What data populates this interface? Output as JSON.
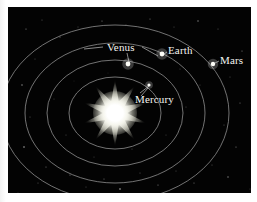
{
  "figure": {
    "title": "Solar System Inner Planets Orbit Diagram",
    "background_color": "#030303",
    "page_color": "#fdfdfd",
    "orbit_color": "#9a9a9a",
    "label_color": "#f4f4f0",
    "sun_color": "#ffffff"
  },
  "sun": {
    "name": "sun",
    "center_x": 107,
    "center_y": 106,
    "points": 10,
    "outer_radius": 34,
    "inner_radius": 12
  },
  "orbits": [
    {
      "name": "mercury-orbit",
      "planet": "Mercury",
      "rx": 46,
      "ry": 36,
      "cx": 107,
      "cy": 106
    },
    {
      "name": "venus-orbit",
      "planet": "Venus",
      "rx": 68,
      "ry": 53,
      "cx": 107,
      "cy": 106
    },
    {
      "name": "earth-orbit",
      "planet": "Earth",
      "rx": 90,
      "ry": 70,
      "cx": 107,
      "cy": 106
    },
    {
      "name": "mars-orbit",
      "planet": "Mars",
      "rx": 114,
      "ry": 88,
      "cx": 107,
      "cy": 106
    }
  ],
  "planets": [
    {
      "name": "mercury",
      "label": "Mercury",
      "dot_x": 141,
      "dot_y": 78,
      "dot_r": 1.6,
      "label_x": 127,
      "label_y": 96,
      "leader": {
        "x1": 140,
        "y1": 81,
        "x2": 133,
        "y2": 89
      }
    },
    {
      "name": "venus",
      "label": "Venus",
      "dot_x": 120,
      "dot_y": 57,
      "dot_r": 2.4,
      "label_x": 99,
      "label_y": 44,
      "leader": {
        "x1": 121,
        "y1": 55,
        "x2": 119,
        "y2": 46
      }
    },
    {
      "name": "earth",
      "label": "Earth",
      "dot_x": 154,
      "dot_y": 47,
      "dot_r": 2.4,
      "label_x": 160,
      "label_y": 47,
      "leader": {
        "x1": 156,
        "y1": 47,
        "x2": 159,
        "y2": 45
      }
    },
    {
      "name": "mars",
      "label": "Mars",
      "dot_x": 205,
      "dot_y": 57,
      "dot_r": 2.2,
      "label_x": 212,
      "label_y": 57,
      "leader": {
        "x1": 207,
        "y1": 56,
        "x2": 211,
        "y2": 54
      }
    }
  ],
  "leader_lines": [
    {
      "name": "venus-leader-left",
      "x1": 76,
      "y1": 42,
      "x2": 95,
      "y2": 40
    },
    {
      "name": "venus-leader-right",
      "x1": 134,
      "y1": 40,
      "x2": 150,
      "y2": 49
    },
    {
      "name": "mercury-leader",
      "x1": 132,
      "y1": 86,
      "x2": 141,
      "y2": 79
    }
  ],
  "starfield": [
    {
      "x": 18,
      "y": 22,
      "r": 0.6,
      "o": 0.55
    },
    {
      "x": 34,
      "y": 13,
      "r": 0.5,
      "o": 0.4
    },
    {
      "x": 52,
      "y": 30,
      "r": 0.6,
      "o": 0.5
    },
    {
      "x": 27,
      "y": 52,
      "r": 0.5,
      "o": 0.35
    },
    {
      "x": 14,
      "y": 78,
      "r": 0.7,
      "o": 0.6
    },
    {
      "x": 22,
      "y": 110,
      "r": 0.5,
      "o": 0.4
    },
    {
      "x": 16,
      "y": 140,
      "r": 0.8,
      "o": 0.65
    },
    {
      "x": 38,
      "y": 160,
      "r": 0.6,
      "o": 0.45
    },
    {
      "x": 30,
      "y": 176,
      "r": 0.5,
      "o": 0.4
    },
    {
      "x": 62,
      "y": 168,
      "r": 0.6,
      "o": 0.5
    },
    {
      "x": 78,
      "y": 180,
      "r": 0.5,
      "o": 0.35
    },
    {
      "x": 96,
      "y": 172,
      "r": 0.6,
      "o": 0.45
    },
    {
      "x": 112,
      "y": 182,
      "r": 0.8,
      "o": 0.7
    },
    {
      "x": 132,
      "y": 166,
      "r": 0.5,
      "o": 0.4
    },
    {
      "x": 150,
      "y": 178,
      "r": 0.6,
      "o": 0.5
    },
    {
      "x": 168,
      "y": 164,
      "r": 0.5,
      "o": 0.35
    },
    {
      "x": 186,
      "y": 176,
      "r": 0.6,
      "o": 0.45
    },
    {
      "x": 204,
      "y": 158,
      "r": 0.5,
      "o": 0.4
    },
    {
      "x": 220,
      "y": 170,
      "r": 0.7,
      "o": 0.55
    },
    {
      "x": 228,
      "y": 140,
      "r": 0.6,
      "o": 0.5
    },
    {
      "x": 216,
      "y": 118,
      "r": 0.5,
      "o": 0.4
    },
    {
      "x": 232,
      "y": 96,
      "r": 0.6,
      "o": 0.45
    },
    {
      "x": 222,
      "y": 70,
      "r": 0.5,
      "o": 0.35
    },
    {
      "x": 234,
      "y": 44,
      "r": 0.6,
      "o": 0.5
    },
    {
      "x": 210,
      "y": 22,
      "r": 0.5,
      "o": 0.4
    },
    {
      "x": 190,
      "y": 14,
      "r": 0.7,
      "o": 0.55
    },
    {
      "x": 166,
      "y": 20,
      "r": 0.5,
      "o": 0.35
    },
    {
      "x": 142,
      "y": 12,
      "r": 0.6,
      "o": 0.45
    },
    {
      "x": 118,
      "y": 18,
      "r": 0.5,
      "o": 0.4
    },
    {
      "x": 94,
      "y": 14,
      "r": 0.6,
      "o": 0.5
    },
    {
      "x": 70,
      "y": 20,
      "r": 0.5,
      "o": 0.35
    },
    {
      "x": 46,
      "y": 92,
      "r": 0.5,
      "o": 0.3
    },
    {
      "x": 58,
      "y": 128,
      "r": 0.5,
      "o": 0.35
    },
    {
      "x": 86,
      "y": 150,
      "r": 0.5,
      "o": 0.3
    },
    {
      "x": 124,
      "y": 142,
      "r": 0.5,
      "o": 0.35
    },
    {
      "x": 158,
      "y": 128,
      "r": 0.5,
      "o": 0.3
    },
    {
      "x": 178,
      "y": 100,
      "r": 0.5,
      "o": 0.35
    },
    {
      "x": 192,
      "y": 78,
      "r": 0.5,
      "o": 0.3
    },
    {
      "x": 172,
      "y": 62,
      "r": 0.5,
      "o": 0.3
    },
    {
      "x": 100,
      "y": 66,
      "r": 0.4,
      "o": 0.25
    },
    {
      "x": 66,
      "y": 74,
      "r": 0.4,
      "o": 0.25
    },
    {
      "x": 200,
      "y": 190,
      "r": 0.5,
      "o": 0.3
    },
    {
      "x": 242,
      "y": 182,
      "r": 0.5,
      "o": 0.3
    },
    {
      "x": 10,
      "y": 186,
      "r": 0.5,
      "o": 0.3
    }
  ]
}
